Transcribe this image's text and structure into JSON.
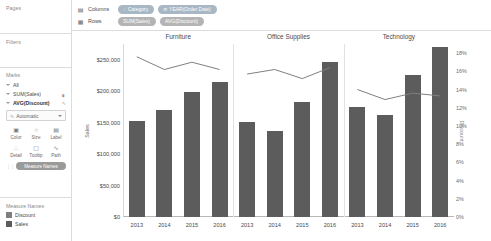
{
  "app": {
    "left_panel": {
      "pages": {
        "title": "Pages"
      },
      "filters": {
        "title": "Filters"
      },
      "marks": {
        "title": "Marks",
        "rows": [
          {
            "label": "All",
            "right_icon": ""
          },
          {
            "label": "SUM(Sales)",
            "right_icon": "bar-icon"
          },
          {
            "label": "AVG(Discount)",
            "right_icon": "line-icon"
          }
        ],
        "mark_type": {
          "label": "Automatic",
          "icon": "mark-type-icon"
        },
        "buttons": [
          {
            "label": "Color",
            "icon": "color-icon",
            "glyph": "▣"
          },
          {
            "label": "Size",
            "icon": "size-icon",
            "glyph": "○"
          },
          {
            "label": "Label",
            "icon": "label-icon",
            "glyph": "▤"
          },
          {
            "label": "Detail",
            "icon": "detail-icon",
            "glyph": "∴"
          },
          {
            "label": "Tooltip",
            "icon": "tooltip-icon",
            "glyph": "▢"
          },
          {
            "label": "Path",
            "icon": "path-icon",
            "glyph": "∿"
          }
        ],
        "measure_names_pill": "Measure Names",
        "grip": "⁙"
      },
      "legend": {
        "title": "Measure Names",
        "items": [
          {
            "label": "Discount",
            "color": "#7f7f7f"
          },
          {
            "label": "Sales",
            "color": "#5c5c5c"
          }
        ]
      }
    },
    "shelves": {
      "columns": {
        "icon": "columns-icon",
        "label": "Columns",
        "pills": [
          {
            "text": "Category",
            "icon": "∴",
            "kind": "blue"
          },
          {
            "text": "YEAR(Order Date)",
            "icon": "⊞",
            "kind": "blue"
          }
        ]
      },
      "rows": {
        "icon": "rows-icon",
        "label": "Rows",
        "pills": [
          {
            "text": "SUM(Sales)",
            "icon": "",
            "kind": "green"
          },
          {
            "text": "AVG(Discount)",
            "icon": "",
            "kind": "green"
          }
        ]
      }
    }
  },
  "chart_data": {
    "type": "bar",
    "title": "",
    "panels": [
      "Furniture",
      "Office Supplies",
      "Technology"
    ],
    "categories": [
      "2013",
      "2014",
      "2015",
      "2016"
    ],
    "xlabel": "",
    "ylabel": "Sales",
    "y2label": "Discount",
    "ylim": [
      0,
      275000
    ],
    "y2lim": [
      0,
      0.19
    ],
    "yticks": [
      "$0",
      "$50,000",
      "$100,000",
      "$150,000",
      "$200,000",
      "$250,000"
    ],
    "ytick_values": [
      0,
      50000,
      100000,
      150000,
      200000,
      250000
    ],
    "y2ticks": [
      "0%",
      "2%",
      "4%",
      "6%",
      "8%",
      "10%",
      "12%",
      "14%",
      "16%",
      "18%"
    ],
    "y2tick_values": [
      0,
      2,
      4,
      6,
      8,
      10,
      12,
      14,
      16,
      18
    ],
    "grid": false,
    "legend": "left-panel",
    "series": [
      {
        "name": "Sales",
        "type": "bar",
        "color": "#5c5c5c",
        "axis": "left",
        "panel_values": {
          "Furniture": [
            152000,
            170000,
            198000,
            215000
          ],
          "Office Supplies": [
            151000,
            137000,
            183000,
            246000
          ],
          "Technology": [
            175000,
            162000,
            226000,
            271000
          ]
        }
      },
      {
        "name": "Discount",
        "type": "line",
        "color": "#7f7f7f",
        "axis": "right",
        "panel_values": {
          "Furniture": [
            17.6,
            16.2,
            17.0,
            16.2
          ],
          "Office Supplies": [
            15.7,
            16.2,
            15.2,
            16.4
          ],
          "Technology": [
            14.0,
            12.9,
            13.6,
            13.3
          ]
        }
      }
    ]
  }
}
